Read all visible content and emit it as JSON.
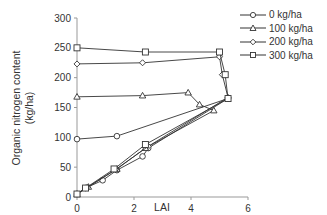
{
  "chart_data": {
    "type": "line",
    "title": "",
    "xlabel": "LAI",
    "ylabel": "Organic nitrogen content (kg/ha)",
    "ylabel_lines": [
      "Organic nitrogen content",
      "(kg/ha)"
    ],
    "xlim": [
      0,
      6
    ],
    "ylim": [
      0,
      300
    ],
    "xticks": [
      0,
      2,
      4,
      6
    ],
    "yticks": [
      0,
      50,
      100,
      150,
      200,
      250,
      300
    ],
    "grid": false,
    "legend_position": "right",
    "series": [
      {
        "name": "0 kg/ha",
        "marker": "circle",
        "x": [
          0,
          0.3,
          0.9,
          1.4,
          2.3,
          1.4,
          0
        ],
        "y": [
          5,
          15,
          28,
          45,
          68,
          102,
          97
        ],
        "points": [
          [
            0,
            5
          ],
          [
            0.3,
            15
          ],
          [
            0.9,
            28
          ],
          [
            1.4,
            45
          ],
          [
            2.3,
            68
          ],
          [
            2.5,
            82
          ],
          [
            5.3,
            165
          ],
          [
            1.4,
            102
          ],
          [
            0,
            97
          ]
        ]
      },
      {
        "name": "100 kg/ha",
        "marker": "triangle",
        "points": [
          [
            0,
            5
          ],
          [
            0.4,
            17
          ],
          [
            1.4,
            47
          ],
          [
            2.4,
            82
          ],
          [
            4.8,
            145
          ],
          [
            4.3,
            155
          ],
          [
            3.9,
            175
          ],
          [
            2.3,
            170
          ],
          [
            0,
            168
          ]
        ]
      },
      {
        "name": "200 kg/ha",
        "marker": "diamond",
        "points": [
          [
            0,
            5
          ],
          [
            0.35,
            16
          ],
          [
            1.35,
            46
          ],
          [
            2.5,
            85
          ],
          [
            5.3,
            167
          ],
          [
            5.1,
            205
          ],
          [
            5.0,
            235
          ],
          [
            2.3,
            225
          ],
          [
            0,
            223
          ]
        ]
      },
      {
        "name": "300 kg/ha",
        "marker": "square",
        "points": [
          [
            0,
            5
          ],
          [
            0.3,
            15
          ],
          [
            1.3,
            47
          ],
          [
            2.4,
            88
          ],
          [
            5.3,
            165
          ],
          [
            5.2,
            205
          ],
          [
            5.0,
            243
          ],
          [
            2.4,
            243
          ],
          [
            0,
            250
          ]
        ]
      }
    ]
  },
  "legend": {
    "items": [
      {
        "label": "0 kg/ha",
        "marker": "circle"
      },
      {
        "label": "100 kg/ha",
        "marker": "triangle"
      },
      {
        "label": "200 kg/ha",
        "marker": "diamond"
      },
      {
        "label": "300 kg/ha",
        "marker": "square"
      }
    ]
  },
  "colors": {
    "line": "#333333",
    "axis": "#999999",
    "marker_fill": "#ffffff"
  }
}
